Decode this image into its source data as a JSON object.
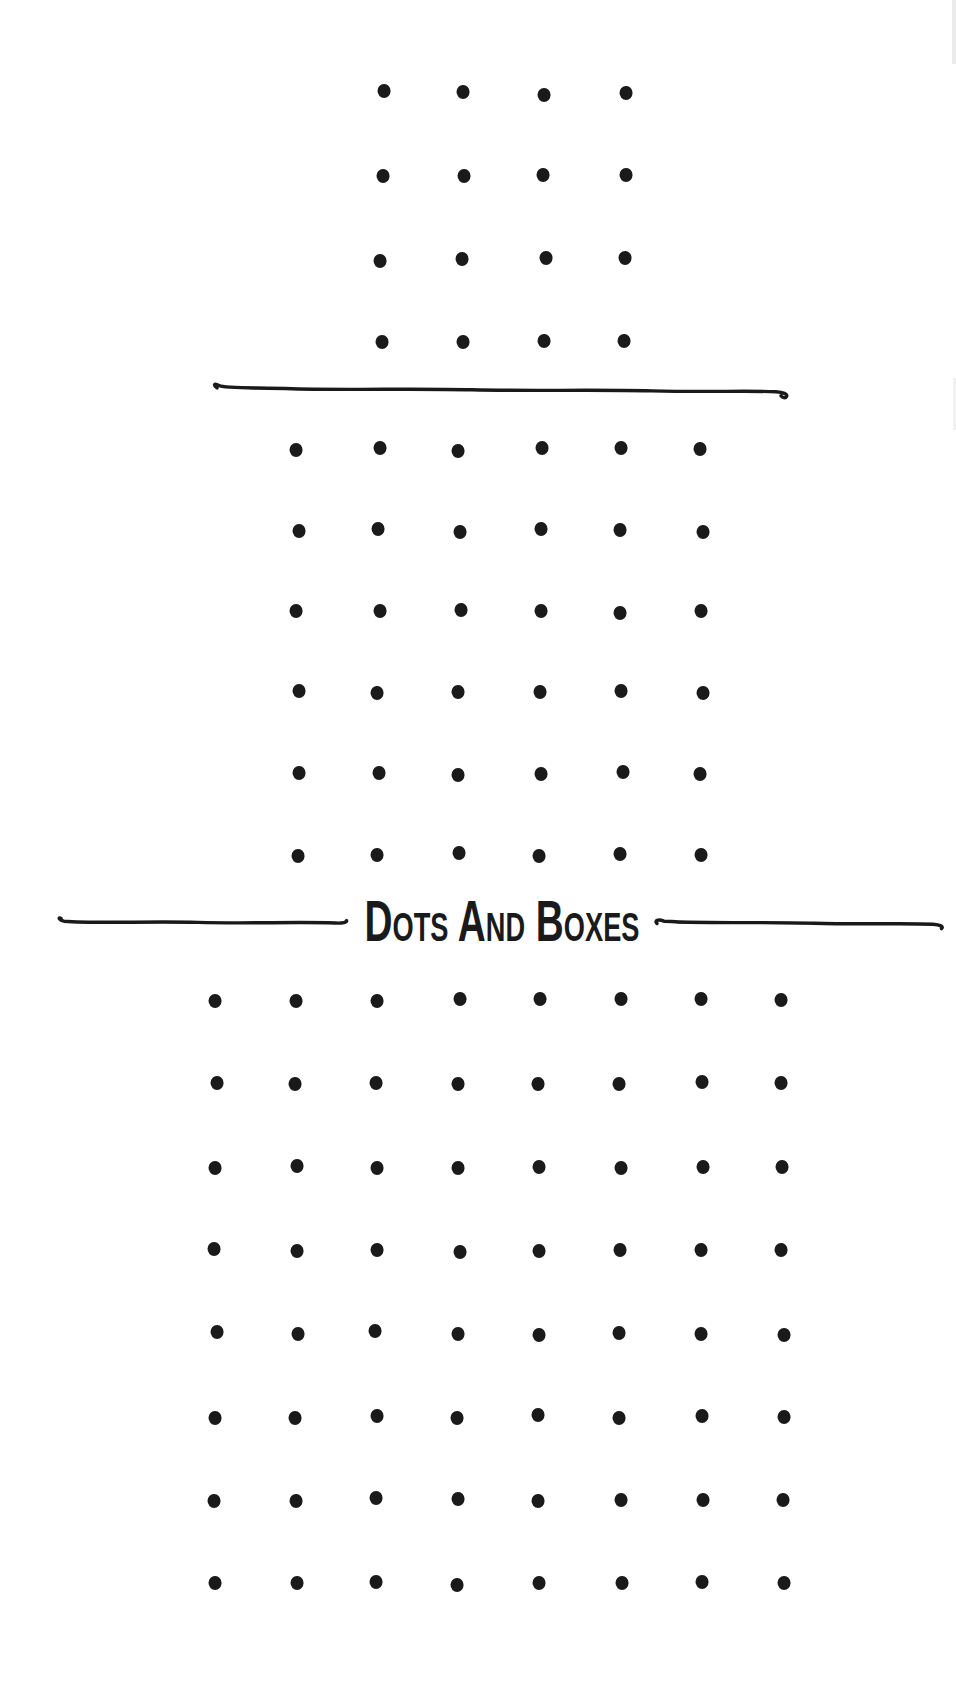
{
  "page": {
    "kind": "dots-and-boxes-game-page"
  },
  "title": {
    "text": "DOTS AND BOXES",
    "render_text": "Dots And Boxes"
  },
  "colors": {
    "ink": "#1a1a1a",
    "paper": "#ffffff"
  },
  "boards": [
    {
      "name": "board-4x4",
      "rows": 4,
      "cols": 4,
      "origin_x": 382,
      "origin_y": 93,
      "spacing_x": 81.3,
      "spacing_y": 83
    },
    {
      "name": "board-6x6",
      "rows": 6,
      "cols": 6,
      "origin_x": 298,
      "origin_y": 449,
      "spacing_x": 80.8,
      "spacing_y": 81.2
    },
    {
      "name": "board-8x8",
      "rows": 8,
      "cols": 8,
      "origin_x": 215,
      "origin_y": 1000,
      "spacing_x": 81,
      "spacing_y": 83.3
    }
  ],
  "dividers": {
    "separator": {
      "x": 210,
      "y": 380,
      "width": 584,
      "height": 22
    },
    "title_left": {
      "x": 56,
      "y": 912,
      "width": 296,
      "height": 20
    },
    "title_right": {
      "x": 652,
      "y": 914,
      "width": 296,
      "height": 20
    }
  }
}
